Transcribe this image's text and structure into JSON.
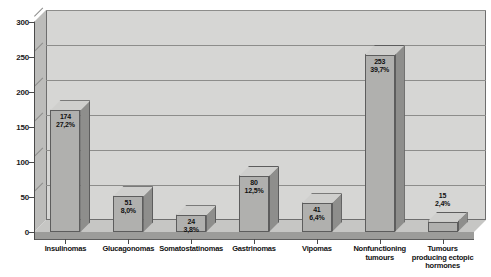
{
  "chart_data": {
    "type": "bar",
    "title": "",
    "subtitle": "",
    "xlabel": "",
    "ylabel": "",
    "ylim": [
      0,
      300
    ],
    "yticks": [
      0,
      50,
      100,
      150,
      200,
      250,
      300
    ],
    "grid": true,
    "legend": null,
    "style": "3d-bar-grayscale",
    "categories": [
      "Insulinomas",
      "Glucagonomas",
      "Somatostatinomas",
      "Gastrinomas",
      "Vipomas",
      "Nonfunctioning tumours",
      "Tumours producing ectopic hormones"
    ],
    "category_label_lines": [
      [
        "Insulinomas"
      ],
      [
        "Glucagonomas"
      ],
      [
        "Somatostatinomas"
      ],
      [
        "Gastrinomas"
      ],
      [
        "Vipomas"
      ],
      [
        "Nonfunctioning",
        "tumours"
      ],
      [
        "Tumours",
        "producing ectopic",
        "hormones"
      ]
    ],
    "values": [
      174,
      51,
      24,
      80,
      41,
      253,
      15
    ],
    "percent_labels": [
      "27,2%",
      "8,0%",
      "3,8%",
      "12,5%",
      "6,4%",
      "39,7%",
      "2,4%"
    ],
    "value_labels": [
      "174",
      "51",
      "24",
      "80",
      "41",
      "253",
      "15"
    ],
    "bars": [
      {
        "category": "Insulinomas",
        "value": 174,
        "value_label": "174",
        "percent_label": "27,2%",
        "label_position": "inside"
      },
      {
        "category": "Glucagonomas",
        "value": 51,
        "value_label": "51",
        "percent_label": "8,0%",
        "label_position": "inside"
      },
      {
        "category": "Somatostatinomas",
        "value": 24,
        "value_label": "24",
        "percent_label": "3,8%",
        "label_position": "inside"
      },
      {
        "category": "Gastrinomas",
        "value": 80,
        "value_label": "80",
        "percent_label": "12,5%",
        "label_position": "inside"
      },
      {
        "category": "Vipomas",
        "value": 41,
        "value_label": "41",
        "percent_label": "6,4%",
        "label_position": "inside"
      },
      {
        "category": "Nonfunctioning tumours",
        "value": 253,
        "value_label": "253",
        "percent_label": "39,7%",
        "label_position": "inside"
      },
      {
        "category": "Tumours producing ectopic hormones",
        "value": 15,
        "value_label": "15",
        "percent_label": "2,4%",
        "label_position": "above"
      }
    ],
    "colors": {
      "bar_front": "#b0b0ae",
      "bar_side": "#8e8e8c",
      "bar_top": "#cfcfcd",
      "bar_outline": "#5d5d5d",
      "plot_background": "#d6d6d4",
      "gridline": "#8d8d8b",
      "axis": "#4a4a4a",
      "text": "#111111",
      "page_background": "#ffffff"
    }
  }
}
